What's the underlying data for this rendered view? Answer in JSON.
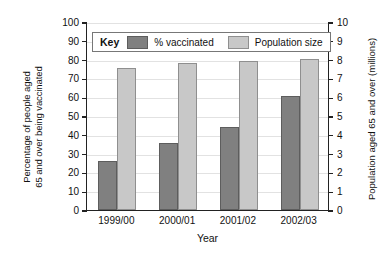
{
  "chart_data": {
    "type": "bar",
    "title": "",
    "xlabel": "Year",
    "categories": [
      "1999/00",
      "2000/01",
      "2001/02",
      "2002/03"
    ],
    "series": [
      {
        "name": "% vaccinated",
        "axis": "left",
        "color": "#808080",
        "values": [
          26,
          35.5,
          44,
          60.5
        ]
      },
      {
        "name": "Population size",
        "axis": "right",
        "color": "#c8c8c8",
        "values": [
          7.55,
          7.8,
          7.9,
          8.05
        ]
      }
    ],
    "left_axis": {
      "label_line1": "Percentage of people aged",
      "label_line2": "65 and over being vaccinated",
      "ticks": [
        0,
        10,
        20,
        30,
        40,
        50,
        60,
        70,
        80,
        90,
        100
      ],
      "ylim": [
        0,
        100
      ]
    },
    "right_axis": {
      "label": "Population aged 65 and over (millions)",
      "ticks": [
        0,
        1,
        2,
        3,
        4,
        5,
        6,
        7,
        8,
        9,
        10
      ],
      "ylim": [
        0,
        10
      ]
    },
    "legend": {
      "key_word": "Key",
      "entries": [
        "% vaccinated",
        "Population size"
      ],
      "position": "top-left-inside"
    },
    "grid": true
  }
}
